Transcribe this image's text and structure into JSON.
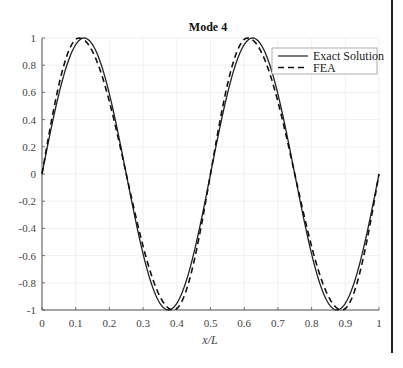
{
  "chart_data": {
    "type": "line",
    "title": "Mode 4",
    "xlabel": "x/L",
    "ylabel": "",
    "xlim": [
      0,
      1
    ],
    "ylim": [
      -1,
      1
    ],
    "grid": true,
    "legend_position": "upper right",
    "x_ticks": [
      "0",
      "0.1",
      "0.2",
      "0.3",
      "0.4",
      "0.5",
      "0.6",
      "0.7",
      "0.8",
      "0.9",
      "1"
    ],
    "y_ticks": [
      "1",
      "0.8",
      "0.6",
      "0.4",
      "0.2",
      "0",
      "-0.2",
      "-0.4",
      "-0.6",
      "-0.8",
      "-1"
    ],
    "series": [
      {
        "name": "Exact Solution",
        "style": "solid",
        "color": "#222222",
        "x": [
          0,
          0.125,
          0.25,
          0.375,
          0.5,
          0.625,
          0.75,
          0.875,
          1
        ],
        "values": [
          0,
          1,
          0,
          -1,
          0,
          1,
          0,
          -1,
          0
        ]
      },
      {
        "name": "FEA",
        "style": "dashed",
        "color": "#111111",
        "x": [
          0,
          0.11,
          0.25,
          0.39,
          0.5,
          0.61,
          0.75,
          0.89,
          1
        ],
        "values": [
          0,
          1,
          0,
          -1,
          0,
          1,
          0,
          -1,
          0
        ]
      }
    ]
  },
  "legend": {
    "items": [
      {
        "label": "Exact Solution"
      },
      {
        "label": "FEA"
      }
    ]
  }
}
